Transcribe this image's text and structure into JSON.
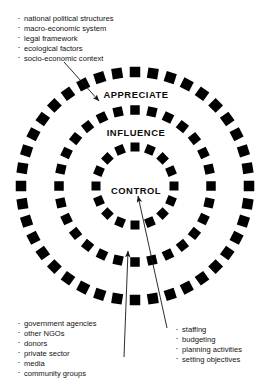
{
  "diagram": {
    "title_text_present": false,
    "rings": [
      {
        "id": "outer",
        "label": "APPRECIATE",
        "center_x": 135,
        "center_y": 186,
        "radius": 114,
        "dash_count": 40,
        "dash_size": 10.5
      },
      {
        "id": "middle",
        "label": "INFLUENCE",
        "center_x": 135,
        "center_y": 186,
        "radius": 76,
        "dash_count": 28,
        "dash_size": 9.5
      },
      {
        "id": "inner",
        "label": "CONTROL",
        "center_x": 135,
        "center_y": 186,
        "radius": 39,
        "dash_count": 16,
        "dash_size": 9.0
      }
    ],
    "dash_color": "#000000",
    "text_color": "#131313",
    "background_color": "#ffffff",
    "lists": {
      "context": {
        "name": "external context factors",
        "items": [
          "national political structures",
          "macro-economic system",
          "legal framework",
          "ecological factors",
          "socio-economic context"
        ]
      },
      "actors": {
        "name": "external actors",
        "items": [
          "government agencies",
          "other NGOs",
          "donors",
          "private sector",
          "media",
          "community groups"
        ]
      },
      "internal": {
        "name": "internal control activities",
        "items": [
          "staffing",
          "budgeting",
          "planning activities",
          "setting objectives"
        ]
      }
    },
    "arrows": [
      {
        "id": "context-to-appreciate",
        "from_x": 64,
        "from_y": 62,
        "to_x": 99,
        "to_y": 101
      },
      {
        "id": "actors-to-influence",
        "from_x": 124,
        "from_y": 357,
        "to_x": 128,
        "to_y": 251
      },
      {
        "id": "internal-to-control",
        "from_x": 167,
        "from_y": 328,
        "to_x": 138,
        "to_y": 196
      }
    ]
  }
}
